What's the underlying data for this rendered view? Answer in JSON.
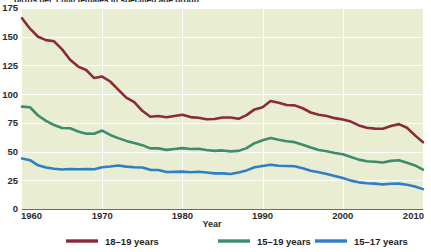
{
  "figure": {
    "title_partial": "births per 1,000 females in specified age group",
    "background_color": "#ffffff",
    "plot_background_color": "#e9edd1",
    "gridline_color": "#ffffff"
  },
  "chart_data": {
    "type": "line",
    "title": "births per 1,000 females in specified age group",
    "xlabel": "Year",
    "ylabel": "",
    "xlim": [
      1960,
      2010
    ],
    "ylim": [
      0,
      175
    ],
    "grid": true,
    "legend_position": "bottom",
    "xticks": [
      1960,
      1970,
      1980,
      1990,
      2000,
      2010
    ],
    "xtick_labels": [
      "1960",
      "1970",
      "1980",
      "1990",
      "2000",
      "2010"
    ],
    "yticks": [
      0,
      25,
      50,
      75,
      100,
      125,
      150,
      175
    ],
    "ytick_labels": [
      "0",
      "25",
      "50",
      "75",
      "100",
      "125",
      "150",
      "175"
    ],
    "x": [
      1960,
      1961,
      1962,
      1963,
      1964,
      1965,
      1966,
      1967,
      1968,
      1969,
      1970,
      1971,
      1972,
      1973,
      1974,
      1975,
      1976,
      1977,
      1978,
      1979,
      1980,
      1981,
      1982,
      1983,
      1984,
      1985,
      1986,
      1987,
      1988,
      1989,
      1990,
      1991,
      1992,
      1993,
      1994,
      1995,
      1996,
      1997,
      1998,
      1999,
      2000,
      2001,
      2002,
      2003,
      2004,
      2005,
      2006,
      2007,
      2008,
      2009,
      2010
    ],
    "series": [
      {
        "name": "18-19 years",
        "label": "18–19 years",
        "color": "#8a2a3c",
        "values": [
          166.1,
          157.0,
          150.0,
          147.0,
          146.0,
          139.0,
          130.0,
          124.0,
          121.0,
          114.0,
          115.3,
          111.0,
          104.0,
          97.0,
          93.0,
          85.5,
          80.3,
          81.0,
          79.8,
          81.0,
          82.1,
          80.0,
          79.4,
          78.1,
          78.3,
          79.6,
          79.6,
          78.5,
          81.7,
          86.7,
          88.6,
          94.0,
          92.5,
          90.5,
          90.2,
          87.7,
          84.0,
          82.1,
          80.9,
          79.1,
          77.9,
          76.1,
          72.8,
          70.8,
          70.0,
          69.9,
          72.2,
          73.9,
          70.7,
          64.1,
          58.2
        ]
      },
      {
        "name": "15-19 years",
        "label": "15–19 years",
        "color": "#3d8d6d",
        "values": [
          89.1,
          88.6,
          81.4,
          76.7,
          73.1,
          70.5,
          70.3,
          67.5,
          65.6,
          65.5,
          68.3,
          64.5,
          61.7,
          59.3,
          57.5,
          55.6,
          52.8,
          52.8,
          51.5,
          52.3,
          53.0,
          52.2,
          52.4,
          51.4,
          50.6,
          51.0,
          50.2,
          50.6,
          53.0,
          57.3,
          59.9,
          61.8,
          60.3,
          59.0,
          58.2,
          56.0,
          53.5,
          51.3,
          50.3,
          48.8,
          47.7,
          45.3,
          43.0,
          41.6,
          41.1,
          40.5,
          41.9,
          42.5,
          40.2,
          37.9,
          34.2
        ]
      },
      {
        "name": "15-17 years",
        "label": "15–17 years",
        "color": "#2f7fc6",
        "values": [
          43.9,
          42.5,
          38.0,
          36.1,
          35.0,
          34.4,
          34.8,
          34.6,
          34.8,
          34.6,
          36.4,
          37.0,
          37.8,
          36.9,
          36.3,
          36.1,
          34.1,
          33.9,
          32.2,
          32.3,
          32.5,
          32.0,
          32.4,
          31.8,
          31.0,
          31.0,
          30.5,
          31.7,
          33.6,
          36.4,
          37.5,
          38.6,
          37.6,
          37.5,
          37.2,
          35.5,
          33.3,
          32.0,
          30.4,
          28.7,
          26.9,
          24.7,
          23.2,
          22.4,
          22.1,
          21.4,
          22.0,
          22.1,
          21.1,
          19.6,
          17.3
        ]
      }
    ]
  },
  "legend": {
    "items": [
      {
        "label": "18–19 years",
        "color": "#8a2a3c"
      },
      {
        "label": "15–19 years",
        "color": "#3d8d6d"
      },
      {
        "label": "15–17 years",
        "color": "#2f7fc6"
      }
    ]
  },
  "axis": {
    "x_title": "Year"
  }
}
